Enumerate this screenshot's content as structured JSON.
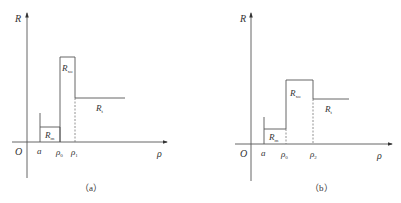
{
  "panels": [
    {
      "caption": "（a）",
      "y_axis_label": "R",
      "x_axis_label": "ρ",
      "origin_label": "O",
      "x_ticks": [
        {
          "base": "a",
          "sub": ""
        },
        {
          "base": "ρ",
          "sub": "0"
        },
        {
          "base": "ρ",
          "sub": "1"
        }
      ],
      "regions": [
        {
          "base": "R",
          "sub": "m"
        },
        {
          "base": "R",
          "sub": "xo"
        },
        {
          "base": "R",
          "sub": "t"
        }
      ]
    },
    {
      "caption": "（b）",
      "y_axis_label": "R",
      "x_axis_label": "ρ",
      "origin_label": "O",
      "x_ticks": [
        {
          "base": "a",
          "sub": ""
        },
        {
          "base": "ρ",
          "sub": "0"
        },
        {
          "base": "ρ",
          "sub": "2"
        }
      ],
      "regions": [
        {
          "base": "R",
          "sub": "m"
        },
        {
          "base": "R",
          "sub": "xo"
        },
        {
          "base": "R",
          "sub": "t"
        }
      ]
    }
  ],
  "colors": {
    "line": "#555555",
    "text": "#333333"
  }
}
